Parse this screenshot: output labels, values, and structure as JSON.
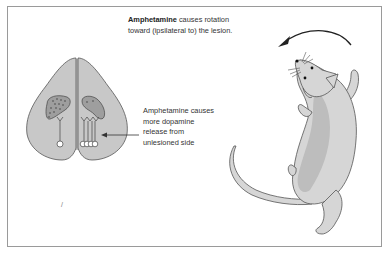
{
  "figure": {
    "top_caption": {
      "bold": "Amphetamine",
      "line1_rest": " causes rotation",
      "line2": "toward (ipsilateral to) the lesion."
    },
    "side_caption": {
      "lines": [
        "Amphetamine causes",
        "more dopamine",
        "release from",
        "unlesioned side"
      ]
    },
    "stray_mark": "/",
    "colors": {
      "brain_fill": "#c8c8c8",
      "striatum_fill": "#9e9e9e",
      "rat_body": "#d6d6d6",
      "rat_belly": "#bdbdbd",
      "outline": "#555555",
      "border": "#9a9a9a"
    }
  }
}
